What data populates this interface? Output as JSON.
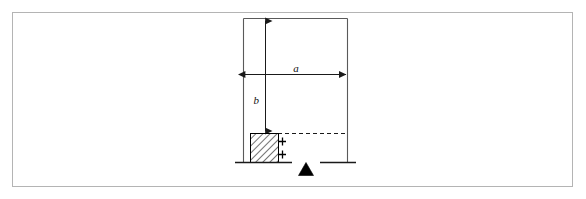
{
  "figure": {
    "labels": {
      "width_dimension": "a",
      "height_dimension": "b"
    },
    "colors": {
      "line": "#1a1a1a",
      "frame": "#b0b0b0",
      "hatch": "#000000",
      "background": "#ffffff",
      "support": "#000000"
    },
    "elements": {
      "outer_frame": "outer-frame-border",
      "body_rectangle": "rigid-body-outline",
      "width_arrow": "horizontal-dimension-arrow-a",
      "height_arrow": "vertical-dimension-arrow-b",
      "hatched_block": "hatched-block",
      "dashed_reference_line": "dashed-reference-line",
      "baseline_left": "ground-line-left",
      "baseline_right": "ground-line-right",
      "pivot_support": "triangular-pivot-support",
      "tick_mark_upper": "block-tick-mark-upper",
      "tick_mark_lower": "block-tick-mark-lower"
    }
  }
}
